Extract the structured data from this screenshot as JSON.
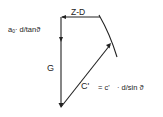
{
  "diagram": {
    "type": "force-polygon",
    "stroke_color": "#222222",
    "labels": {
      "zd": "Z-D",
      "a0_main": "a",
      "a0_sub": "0",
      "a0_rest": "· d/tanϑ",
      "g": "G",
      "c_prime": "C'",
      "c_eq": "= c'",
      "c_rest": "· d/sin ϑ"
    },
    "vectors": [
      {
        "name": "Z-D",
        "from": [
          100,
          17
        ],
        "to": [
          61,
          17
        ]
      },
      {
        "name": "a0·d/tanϑ",
        "from": [
          61,
          17
        ],
        "to": [
          61,
          40
        ]
      },
      {
        "name": "G",
        "from": [
          61,
          40
        ],
        "to": [
          61,
          107
        ]
      },
      {
        "name": "C'",
        "from": [
          61,
          107
        ],
        "to": [
          111,
          44
        ]
      }
    ],
    "curve": {
      "from": [
        99,
        15
      ],
      "to": [
        117,
        57
      ]
    }
  }
}
